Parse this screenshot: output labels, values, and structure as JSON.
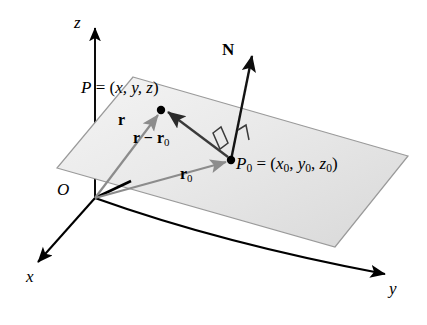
{
  "figure": {
    "background_color": "#ffffff",
    "width": 427,
    "height": 325
  },
  "colors": {
    "plane_fill_light": "#f2f2f2",
    "plane_fill_dark": "#dcdcdc",
    "plane_border": "#9a9a9a",
    "axis": "#000000",
    "vector_gray": "#8c8c8c",
    "vector_dark": "#2b2b2b",
    "normal_vector": "#1a1a1a",
    "point_dot": "#000000",
    "label_text": "#000000"
  },
  "axes": [
    {
      "name": "z-axis",
      "label": "z",
      "label_x": 74,
      "label_y": 17,
      "italic": true
    },
    {
      "name": "x-axis",
      "label": "x",
      "label_x": 26,
      "label_y": 277,
      "italic": true
    },
    {
      "name": "y-axis",
      "label": "y",
      "label_x": 389,
      "label_y": 289,
      "italic": true
    }
  ],
  "origin": {
    "name": "origin",
    "label": "O",
    "label_x": 57,
    "label_y": 186,
    "point_x": 95,
    "point_y": 198
  },
  "points": [
    {
      "name": "point-P",
      "label_prefix": "P",
      "label_equals": " = (",
      "coords": "x, y, z",
      "label_suffix": ")",
      "full_label": "P = (x, y, z)",
      "dot_x": 161,
      "dot_y": 110,
      "label_x": 81,
      "label_y": 82
    },
    {
      "name": "point-P0",
      "label_prefix": "P",
      "label_sub": "0",
      "label_equals": " = (",
      "coords": "x0, y0, z0",
      "label_suffix": ")",
      "full_label": "P0 = (x0, y0, z0)",
      "dot_x": 231,
      "dot_y": 160,
      "label_x": 236,
      "label_y": 158
    }
  ],
  "vectors": [
    {
      "name": "vector-r",
      "label": "r",
      "label_x": 118,
      "label_y": 118,
      "from_x": 95,
      "from_y": 198,
      "to_x": 158,
      "to_y": 114,
      "style": "gray"
    },
    {
      "name": "vector-r0",
      "label": "r",
      "label_sub": "0",
      "label_x": 180,
      "label_y": 172,
      "from_x": 95,
      "from_y": 198,
      "to_x": 227,
      "to_y": 162,
      "style": "gray"
    },
    {
      "name": "vector-r-minus-r0",
      "label": "r − r",
      "label_sub": "0",
      "label_x": 133,
      "label_y": 136,
      "from_x": 228,
      "from_y": 157,
      "to_x": 167,
      "to_y": 111,
      "style": "dark"
    },
    {
      "name": "vector-N",
      "label": "N",
      "label_x": 222,
      "label_y": 48,
      "from_x": 231,
      "from_y": 160,
      "to_x": 253,
      "to_y": 50,
      "style": "normal"
    }
  ],
  "plane": {
    "name": "plane-surface",
    "corners": [
      {
        "x": 133,
        "y": 77
      },
      {
        "x": 408,
        "y": 156
      },
      {
        "x": 335,
        "y": 247
      },
      {
        "x": 57,
        "y": 168
      }
    ]
  },
  "right_angle_marker": {
    "name": "right-angle-marker",
    "description": "perpendicular symbol at P0 between N and the plane"
  }
}
